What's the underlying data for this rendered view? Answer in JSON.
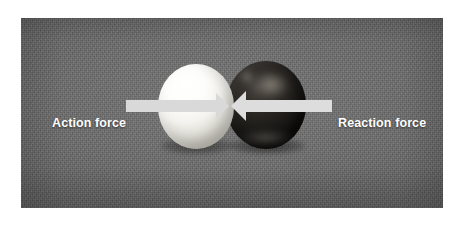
{
  "figure": {
    "kind": "physics-photo-diagram",
    "background_color": "#ffffff"
  },
  "photo": {
    "background_color": "#6c6c6c",
    "surface": "gray textured mat"
  },
  "objects": [
    {
      "id": "ball-white",
      "label": "white ball",
      "color": "#f4f3ef"
    },
    {
      "id": "ball-dark",
      "label": "dark ball",
      "color": "#1a1816"
    }
  ],
  "annotations": {
    "arrow_color": "#d8d8d8",
    "left": {
      "label": "Action force",
      "direction": "right",
      "icon": "arrow-right-icon"
    },
    "right": {
      "label": "Reaction force",
      "direction": "left",
      "icon": "arrow-left-icon"
    }
  }
}
